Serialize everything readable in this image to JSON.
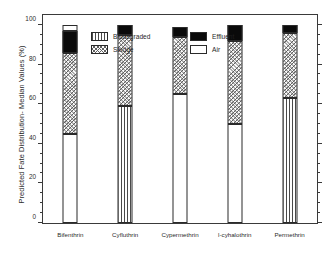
{
  "chart_data": {
    "type": "bar",
    "subtype": "stacked-bar",
    "title": "",
    "xlabel": "",
    "ylabel": "Predicted Fate Distribution- Median Values (%)",
    "ylim": [
      0,
      105
    ],
    "ytick_labels": [
      "0",
      "20",
      "40",
      "60",
      "80",
      "100"
    ],
    "ytick_values": [
      0,
      20,
      40,
      60,
      80,
      100
    ],
    "minor_ticks": true,
    "grid": false,
    "legend_position": "top-left-inside",
    "categories": [
      "Bifenthrin",
      "Cyfluthrin",
      "Cypermethrin",
      "l-cyhalothrin",
      "Permethrin"
    ],
    "series": [
      {
        "name": "Biodegraded",
        "pattern": "vertical-stripes",
        "values": [
          45,
          59,
          65,
          50,
          63
        ]
      },
      {
        "name": "Sludge",
        "pattern": "diagonal-crosshatch",
        "values": [
          41,
          36,
          29,
          42,
          33
        ]
      },
      {
        "name": "Effluent",
        "pattern": "solid-black",
        "values": [
          11,
          5,
          5,
          8,
          4
        ]
      },
      {
        "name": "Air",
        "pattern": "white-open",
        "values": [
          3,
          0,
          0,
          0,
          0
        ]
      }
    ],
    "cumulative_tops": {
      "Bifenthrin": {
        "biodegraded": 45,
        "sludge": 86,
        "effluent": 97,
        "air": 100
      },
      "Cyfluthrin": {
        "biodegraded": 59,
        "sludge": 95,
        "effluent": 100,
        "air": 100
      },
      "Cypermethrin": {
        "biodegraded": 65,
        "sludge": 94,
        "effluent": 99,
        "air": 99
      },
      "l-cyhalothrin": {
        "biodegraded": 50,
        "sludge": 92,
        "effluent": 100,
        "air": 100
      },
      "Permethrin": {
        "biodegraded": 63,
        "sludge": 96,
        "effluent": 100,
        "air": 100
      }
    },
    "colors": {
      "biodegraded": "#4a4a4a",
      "sludge": "#606060",
      "effluent": "#0a0a0a",
      "air": "#ffffff",
      "axis": "#3a3a3a",
      "text": "#1f1f1f"
    }
  },
  "legend": {
    "items": [
      {
        "label": "Biodegraded",
        "fill": "biodegraded"
      },
      {
        "label": "Effluent",
        "fill": "effluent"
      },
      {
        "label": "Sludge",
        "fill": "sludge"
      },
      {
        "label": "Air",
        "fill": "air"
      }
    ]
  }
}
